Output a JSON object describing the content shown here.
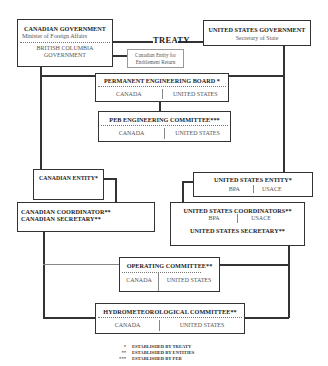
{
  "treaty_label": "TREATY",
  "canadian_government": {
    "title": "CANADIAN GOVERNMENT",
    "subtitle": "Minister of Foreign Affairs",
    "sub_entity_line1": "BRITISH COLUMBIA",
    "sub_entity_line2": "GOVERNMENT"
  },
  "canadian_entitlement": {
    "line1": "Canadian Entity for",
    "line2": "Entitlement Return"
  },
  "us_government": {
    "title": "UNITED STATES GOVERNMENT",
    "subtitle": "Secretary of State"
  },
  "permanent_engineering_board": {
    "title": "PERMANENT ENGINEERING BOARD *",
    "left": "CANADA",
    "right": "UNITED STATES"
  },
  "peb_engineering_committee": {
    "title": "PEB ENGINEERING COMMITTEE***",
    "left": "CANADA",
    "right": "UNITED STATES"
  },
  "canadian_entity": {
    "title": "CANADIAN ENTITY*"
  },
  "us_entity": {
    "title": "UNITED STATES ENTITY*",
    "left": "BPA",
    "right": "USACE"
  },
  "canadian_coordinator": {
    "line1": "CANADIAN COORDINATOR**",
    "line2": "CANADIAN SECRETARY**"
  },
  "us_coordinators": {
    "title": "UNITED STATES COORDINATORS**",
    "left": "BPA",
    "right": "USACE",
    "secretary": "UNITED STATES SECRETARY**"
  },
  "operating_committee": {
    "title": "OPERATING COMMITTEE**",
    "left": "CANADA",
    "right": "UNITED STATES"
  },
  "hydrometeorological_committee": {
    "title": "HYDROMETEOROLOGICAL COMMITTEE**",
    "left": "CANADA",
    "right": "UNITED STATES"
  },
  "legend": [
    {
      "mark": "*",
      "text": "ESTABLISHED BY TREATY"
    },
    {
      "mark": "**",
      "text": "ESTABLISHED BY ENTITIES"
    },
    {
      "mark": "***",
      "text": "ESTABLISHED BY PEB"
    }
  ]
}
